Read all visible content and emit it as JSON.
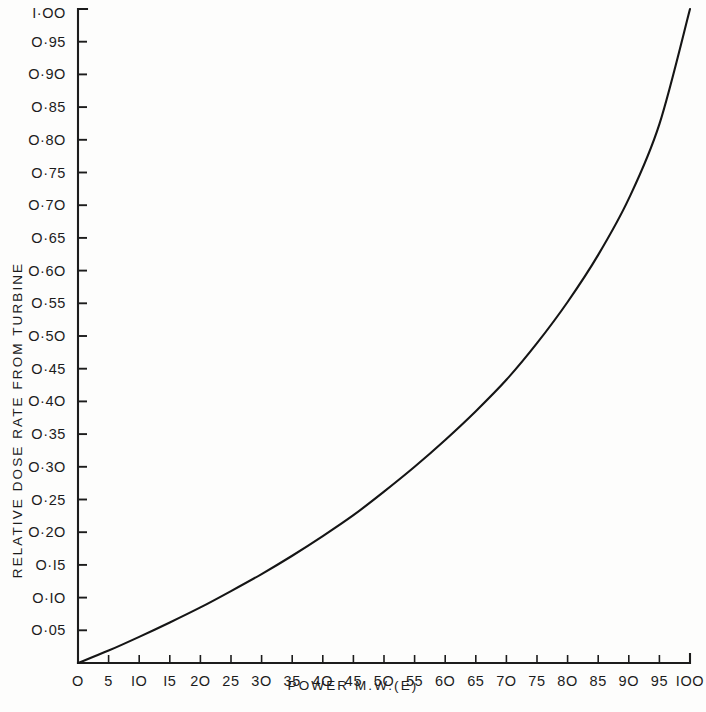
{
  "chart_data": {
    "type": "line",
    "title": "",
    "xlabel": "POWER M.W.(E)",
    "ylabel": "RELATIVE DOSE RATE FROM TURBINE",
    "xlim": [
      0,
      100
    ],
    "ylim": [
      0,
      1.0
    ],
    "grid": false,
    "legend": null,
    "x_tick_labels": [
      "O",
      "5",
      "IO",
      "I5",
      "2O",
      "25",
      "3O",
      "35",
      "4O",
      "45",
      "5O",
      "55",
      "6O",
      "65",
      "7O",
      "75",
      "8O",
      "85",
      "9O",
      "95",
      "IOO"
    ],
    "x_tick_values": [
      0,
      5,
      10,
      15,
      20,
      25,
      30,
      35,
      40,
      45,
      50,
      55,
      60,
      65,
      70,
      75,
      80,
      85,
      90,
      95,
      100
    ],
    "y_tick_labels": [
      "O·05",
      "O·IO",
      "O·I5",
      "O·2O",
      "O·25",
      "O·3O",
      "O·35",
      "O·4O",
      "O·45",
      "O·5O",
      "O·55",
      "O·6O",
      "O·65",
      "O·7O",
      "O·75",
      "O·8O",
      "O·85",
      "O·9O",
      "O·95",
      "I·OO"
    ],
    "y_tick_values": [
      0.05,
      0.1,
      0.15,
      0.2,
      0.25,
      0.3,
      0.35,
      0.4,
      0.45,
      0.5,
      0.55,
      0.6,
      0.65,
      0.7,
      0.75,
      0.8,
      0.85,
      0.9,
      0.95,
      1.0
    ],
    "series": [
      {
        "name": "Relative dose rate from turbine",
        "color": "#151515",
        "x": [
          0,
          5,
          10,
          15,
          20,
          25,
          30,
          35,
          40,
          45,
          50,
          55,
          60,
          65,
          70,
          75,
          80,
          85,
          90,
          95,
          100
        ],
        "values": [
          0.0,
          0.019,
          0.04,
          0.062,
          0.085,
          0.11,
          0.136,
          0.164,
          0.194,
          0.226,
          0.262,
          0.3,
          0.341,
          0.385,
          0.433,
          0.489,
          0.552,
          0.624,
          0.71,
          0.824,
          1.0
        ]
      }
    ]
  },
  "axes": {
    "x_axis_name": "power-axis",
    "y_axis_name": "relative-dose-rate-axis"
  }
}
